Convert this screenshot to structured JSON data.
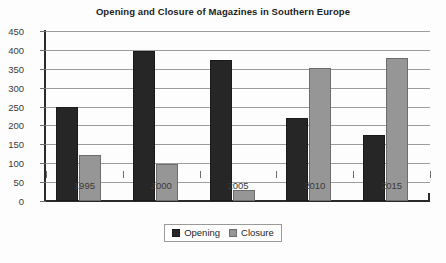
{
  "chart_data": {
    "type": "bar",
    "title": "Opening and Closure of Magazines in Southern Europe",
    "xlabel": "",
    "ylabel": "",
    "categories": [
      "1995",
      "2000",
      "2005",
      "2010",
      "2015"
    ],
    "series": [
      {
        "name": "Opening",
        "color": "#262626",
        "values": [
          250,
          398,
          373,
          220,
          175
        ]
      },
      {
        "name": "Closure",
        "color": "#969696",
        "values": [
          123,
          98,
          30,
          353,
          378
        ]
      }
    ],
    "ylim": [
      0,
      450
    ],
    "ytick_step": 50,
    "yticks": [
      "450",
      "400",
      "350",
      "300",
      "250",
      "200",
      "150",
      "100",
      "50",
      "0"
    ],
    "grid": true,
    "legend_position": "bottom"
  },
  "legend": {
    "items": [
      {
        "label": "Opening",
        "swatch": "opening-swatch"
      },
      {
        "label": "Closure",
        "swatch": "closure-swatch"
      }
    ]
  }
}
